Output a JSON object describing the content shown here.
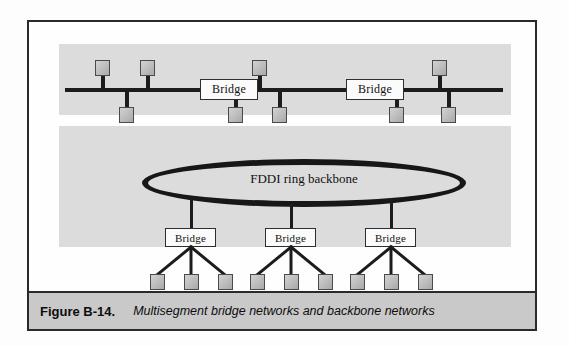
{
  "figure": {
    "caption_label": "Figure B-14.",
    "caption_text": "Multisegment bridge networks and backbone networks",
    "frame_color": "#2a2a2a",
    "panel_color": "#dcdcdc",
    "caption_bar_color": "#c9c9c9",
    "line_color": "#1c1c1c",
    "node_fill": "#c4c4c4",
    "node_border": "#4a4a4a"
  },
  "top_segment": {
    "name": "Multisegment bus network",
    "bridges": [
      {
        "label": "Bridge",
        "x": 171,
        "y": 62
      },
      {
        "label": "Bridge",
        "x": 317,
        "y": 62
      }
    ],
    "bus_lines": [
      {
        "x": 66,
        "y": 70,
        "width": 105
      },
      {
        "x": 229,
        "y": 70,
        "width": 88
      },
      {
        "x": 375,
        "y": 70,
        "width": 99
      }
    ],
    "nodes_above": [
      {
        "x": 95,
        "y": 48
      },
      {
        "x": 140,
        "y": 48
      },
      {
        "x": 252,
        "y": 48
      },
      {
        "x": 432,
        "y": 48
      }
    ],
    "nodes_below": [
      {
        "x": 119,
        "y": 87
      },
      {
        "x": 228,
        "y": 87
      },
      {
        "x": 272,
        "y": 87
      },
      {
        "x": 389,
        "y": 87
      },
      {
        "x": 441,
        "y": 87
      }
    ]
  },
  "bottom_segment": {
    "name": "FDDI ring backbone network",
    "ring_label": "FDDI ring backbone",
    "bridges": [
      {
        "label": "Bridge",
        "x": 162,
        "y": 206
      },
      {
        "label": "Bridge",
        "x": 262,
        "y": 206
      },
      {
        "label": "Bridge",
        "x": 362,
        "y": 206
      }
    ],
    "leaf_nodes": [
      {
        "x": 145,
        "y": 255
      },
      {
        "x": 175,
        "y": 255
      },
      {
        "x": 205,
        "y": 255
      },
      {
        "x": 245,
        "y": 255
      },
      {
        "x": 275,
        "y": 255
      },
      {
        "x": 305,
        "y": 255
      },
      {
        "x": 345,
        "y": 255
      },
      {
        "x": 375,
        "y": 255
      },
      {
        "x": 405,
        "y": 255
      }
    ]
  }
}
